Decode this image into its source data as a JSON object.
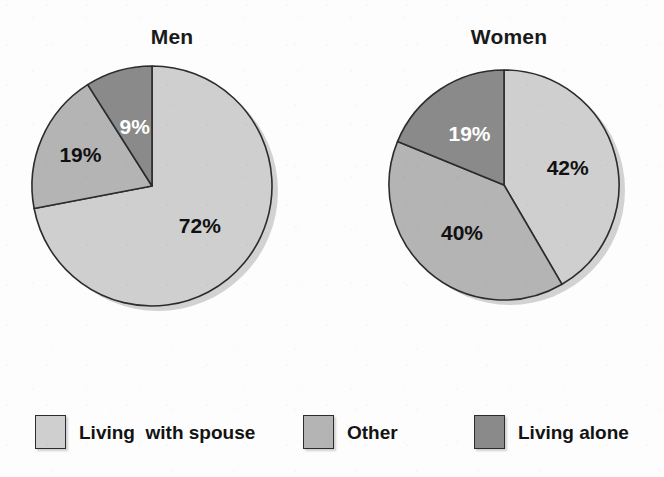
{
  "figure": {
    "background_color": "#fdfdfd"
  },
  "palette": {
    "living_with_spouse": "#cfcfcf",
    "other": "#b4b4b4",
    "living_alone": "#8a8a8a",
    "outline": "#2c2c2c",
    "label_on_dark": "#ffffff",
    "label_on_light": "#111111"
  },
  "legend": {
    "position": "bottom",
    "items": [
      {
        "label": "Living  with spouse",
        "color": "#cfcfcf",
        "key": "living_with_spouse"
      },
      {
        "label": "Other",
        "color": "#b4b4b4",
        "key": "other"
      },
      {
        "label": "Living alone",
        "color": "#8a8a8a",
        "key": "living_alone"
      }
    ]
  },
  "chart_data": [
    {
      "type": "pie",
      "title": "Men",
      "xlabel": "",
      "ylabel": "",
      "start_angle": 0,
      "direction": "clockwise",
      "categories": [
        "Living  with spouse",
        "Other",
        "Living alone"
      ],
      "values": [
        72,
        19,
        9
      ],
      "labels": [
        "72%",
        "19%",
        "9%"
      ],
      "colors": [
        "#cfcfcf",
        "#b4b4b4",
        "#8a8a8a"
      ],
      "label_colors": [
        "#111111",
        "#111111",
        "#ffffff"
      ]
    },
    {
      "type": "pie",
      "title": "Women",
      "xlabel": "",
      "ylabel": "",
      "start_angle": 0,
      "direction": "clockwise",
      "categories": [
        "Living  with spouse",
        "Other",
        "Living alone"
      ],
      "values": [
        42,
        40,
        19
      ],
      "labels": [
        "42%",
        "40%",
        "19%"
      ],
      "colors": [
        "#cfcfcf",
        "#b4b4b4",
        "#8a8a8a"
      ],
      "label_colors": [
        "#111111",
        "#111111",
        "#ffffff"
      ]
    }
  ]
}
